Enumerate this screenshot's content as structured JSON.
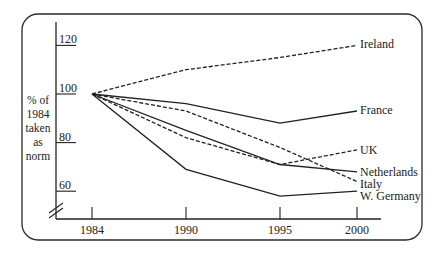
{
  "chart_data": {
    "type": "line",
    "title": "",
    "xlabel": "",
    "ylabel": "% of 1984 taken as norm",
    "ylabel_lines": [
      "% of",
      "1984",
      "taken",
      "as",
      "norm"
    ],
    "x": [
      1984,
      1990,
      1995,
      2000
    ],
    "x_tick_labels": [
      "1984",
      "1990",
      "1995",
      "2000"
    ],
    "y_tick_labels": [
      "120",
      "100",
      "80",
      "60"
    ],
    "y_ticks": [
      120,
      100,
      80,
      60
    ],
    "ylim": [
      52,
      128
    ],
    "axis_break": true,
    "grid": false,
    "legend_position": "inline-right",
    "series": [
      {
        "name": "Ireland",
        "style": "dashed",
        "values": [
          100,
          110,
          115,
          120
        ]
      },
      {
        "name": "France",
        "style": "solid",
        "values": [
          100,
          96,
          88,
          93
        ]
      },
      {
        "name": "UK",
        "style": "dashed",
        "values": [
          100,
          82,
          71,
          77
        ]
      },
      {
        "name": "Netherlands",
        "style": "solid",
        "values": [
          100,
          85,
          71,
          68
        ]
      },
      {
        "name": "Italy",
        "style": "dashed",
        "values": [
          100,
          93,
          78,
          64
        ]
      },
      {
        "name": "W. Germany",
        "style": "solid",
        "values": [
          100,
          69,
          58,
          60
        ]
      }
    ]
  },
  "colors": {
    "line": "#222222",
    "frame": "#2a2a2a",
    "background": "#ffffff"
  }
}
